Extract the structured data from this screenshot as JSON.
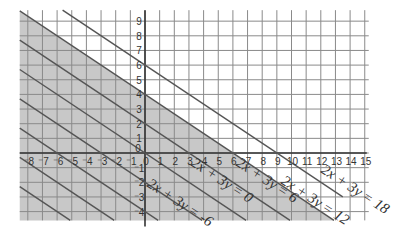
{
  "chart_data": {
    "type": "line",
    "title": "",
    "xlabel": "",
    "ylabel": "",
    "xlim": [
      -8.5,
      15
    ],
    "ylim": [
      -4.6,
      9.7
    ],
    "grid": true,
    "x_ticks": [
      "-8",
      "-7",
      "-6",
      "-5",
      "-4",
      "-3",
      "-2",
      "-1",
      "0",
      "1",
      "2",
      "3",
      "4",
      "5",
      "6",
      "7",
      "8",
      "9",
      "10",
      "11",
      "12",
      "13",
      "14",
      "15"
    ],
    "y_ticks": [
      "-4",
      "-3",
      "-2",
      "-1",
      "0",
      "1",
      "2",
      "3",
      "4",
      "5",
      "6",
      "7",
      "8",
      "9"
    ],
    "shaded_region": {
      "inequality": "2x + 3y <= 12",
      "color": "#c8c8c8"
    },
    "series": [
      {
        "name": "2x + 3y = -6",
        "c": -6,
        "label": "2x + 3y = -6"
      },
      {
        "name": "2x + 3y = 0",
        "c": 0,
        "label": "2x + 3y = 0"
      },
      {
        "name": "2x + 3y = 6",
        "c": 6,
        "label": "2x + 3y = 6"
      },
      {
        "name": "2x + 3y = 12",
        "c": 12,
        "label": "2x + 3y = 12"
      },
      {
        "name": "2x + 3y = 18",
        "c": 18,
        "label": "2x + 3y = 18"
      },
      {
        "name": "2x + 3y = -12",
        "c": -12,
        "label": ""
      },
      {
        "name": "2x + 3y = -18",
        "c": -18,
        "label": ""
      },
      {
        "name": "2x + 3y = -24",
        "c": -24,
        "label": ""
      }
    ]
  },
  "labels": {
    "eq1": {
      "lhs": "2x + 3y",
      "rhs": "= -6"
    },
    "eq2": {
      "lhs": "2x + 3y",
      "rhs": "= 0"
    },
    "eq3": {
      "lhs": "2x + 3y",
      "rhs": "= 6"
    },
    "eq4": {
      "lhs": "2x + 3y",
      "rhs": "= 12"
    },
    "eq5": {
      "lhs": "2x + 3y",
      "rhs": "= 18"
    }
  }
}
